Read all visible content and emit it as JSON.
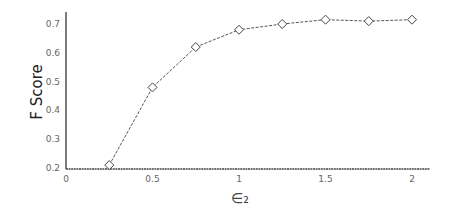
{
  "chart_data": {
    "type": "line",
    "title": "",
    "xlabel": "∈₂",
    "ylabel": "F Score",
    "x": [
      0.25,
      0.5,
      0.75,
      1.0,
      1.25,
      1.5,
      1.75,
      2.0
    ],
    "series": [
      {
        "name": "F Score",
        "values": [
          0.21,
          0.48,
          0.62,
          0.68,
          0.7,
          0.715,
          0.71,
          0.715
        ],
        "marker": "diamond",
        "line_style": "dashed",
        "color": "#555555"
      }
    ],
    "xticks": [
      "0",
      "0.5",
      "1",
      "1.5",
      "2"
    ],
    "yticks": [
      "0.2",
      "0.3",
      "0.4",
      "0.5",
      "0.6",
      "0.7"
    ],
    "xlim": [
      0,
      2.1
    ],
    "ylim": [
      0.2,
      0.74
    ],
    "grid": false,
    "legend": null
  }
}
